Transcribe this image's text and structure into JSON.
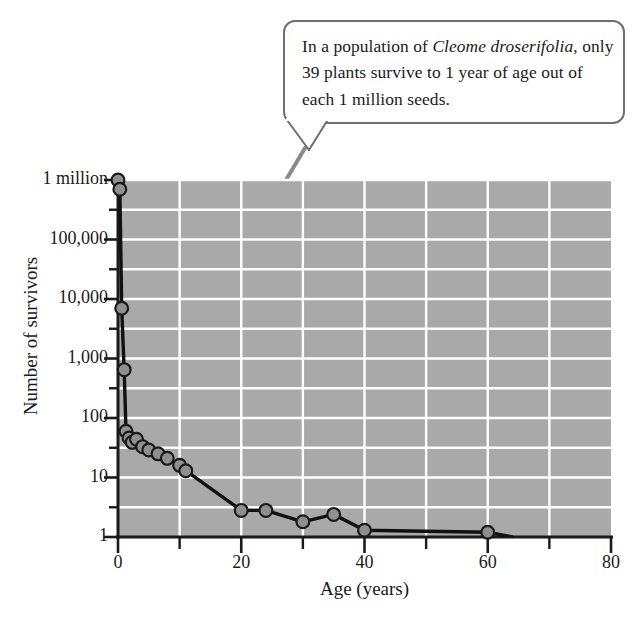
{
  "figure": {
    "background_color": "#ffffff",
    "plot_background_color": "#a9a9a9",
    "grid_color": "#ffffff",
    "axis_color": "#1a1a1a",
    "marker_fill": "#8f8f8f",
    "marker_stroke": "#1a1a1a",
    "leader_color": "#8a8a8a"
  },
  "callout": {
    "name": "annotation-callout",
    "line1_pre": "In a population of ",
    "line1_species": "Cleome droserifolia",
    "line1_post": ",",
    "line2": "only 39 plants survive to 1 year of age",
    "line3": "out of each 1 million seeds.",
    "full_text": "In a population of Cleome droserifolia, only 39 plants survive to 1 year of age out of each 1 million seeds."
  },
  "chart_data": {
    "type": "line",
    "title": "",
    "xlabel": "Age (years)",
    "ylabel": "Number of survivors",
    "yscale": "log",
    "xlim": [
      0,
      80
    ],
    "ylim": [
      1,
      1000000
    ],
    "grid": true,
    "legend": "none",
    "x_ticks": [
      0,
      20,
      40,
      60,
      80
    ],
    "x_tick_labels": [
      "0",
      "20",
      "40",
      "60",
      "80"
    ],
    "x_minor_ticks": [
      10,
      30,
      50,
      70
    ],
    "y_ticks": [
      1,
      10,
      100,
      1000,
      10000,
      100000,
      1000000
    ],
    "y_tick_labels": [
      "1",
      "10",
      "100",
      "1,000",
      "10,000",
      "100,000",
      "1 million"
    ],
    "y_minor_ticks": [
      3.162,
      31.62,
      316.2,
      3162,
      31620,
      316200
    ],
    "series": [
      {
        "name": "Cleome droserifolia survivorship",
        "x": [
          0.0,
          0.3,
          0.6,
          1.0,
          1.3,
          1.8,
          2.3,
          3.0,
          4.0,
          5.0,
          6.5,
          8.0,
          10.0,
          11.0,
          20.0,
          24.0,
          30.0,
          35.0,
          40.0,
          60.0,
          64.0
        ],
        "y": [
          1000000,
          700000,
          7000,
          650,
          60,
          46,
          39,
          44,
          33,
          29,
          25,
          21,
          16,
          13,
          2.8,
          2.8,
          1.8,
          2.4,
          1.3,
          1.2,
          1.0
        ],
        "marker": "circle",
        "marker_points": [
          {
            "x": 0.0,
            "y": 1000000
          },
          {
            "x": 0.3,
            "y": 700000
          },
          {
            "x": 0.6,
            "y": 7000
          },
          {
            "x": 1.0,
            "y": 650
          },
          {
            "x": 1.3,
            "y": 60
          },
          {
            "x": 1.8,
            "y": 46
          },
          {
            "x": 2.3,
            "y": 39
          },
          {
            "x": 3.0,
            "y": 44
          },
          {
            "x": 4.0,
            "y": 33
          },
          {
            "x": 5.0,
            "y": 29
          },
          {
            "x": 6.5,
            "y": 25
          },
          {
            "x": 8.0,
            "y": 21
          },
          {
            "x": 10.0,
            "y": 16
          },
          {
            "x": 11.0,
            "y": 13
          },
          {
            "x": 20.0,
            "y": 2.8
          },
          {
            "x": 24.0,
            "y": 2.8
          },
          {
            "x": 30.0,
            "y": 1.8
          },
          {
            "x": 35.0,
            "y": 2.4
          },
          {
            "x": 40.0,
            "y": 1.3
          },
          {
            "x": 60.0,
            "y": 1.2
          }
        ]
      }
    ],
    "annotations": [
      {
        "text": "In a population of Cleome droserifolia, only 39 plants survive to 1 year of age out of each 1 million seeds.",
        "points_to": {
          "x": 2.3,
          "y": 39
        }
      }
    ]
  }
}
